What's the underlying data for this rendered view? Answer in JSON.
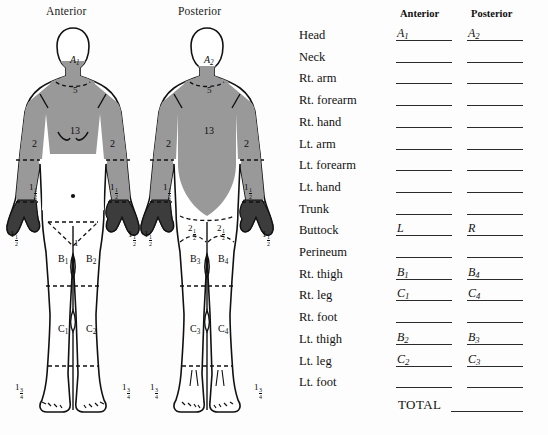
{
  "figures": {
    "anterior_title": "Anterior",
    "posterior_title": "Posterior",
    "shade_color": "#999999",
    "outline_color": "#111111",
    "anterior_annotations": [
      {
        "id": "head",
        "text": "A",
        "sub": "1",
        "size": "lg",
        "italic": true,
        "x": 70,
        "y": 41
      },
      {
        "id": "neck",
        "text": "5",
        "size": "md",
        "italic": false,
        "x": 73,
        "y": 72
      },
      {
        "id": "trunk",
        "text": "13",
        "size": "lg",
        "italic": false,
        "x": 70,
        "y": 112
      },
      {
        "id": "rt-arm",
        "text": "2",
        "size": "lg",
        "italic": false,
        "x": 32,
        "y": 125
      },
      {
        "id": "lt-arm",
        "text": "2",
        "size": "lg",
        "italic": false,
        "x": 110,
        "y": 125
      },
      {
        "id": "rt-forearm",
        "text": "1",
        "frac": "1/2",
        "size": "md",
        "italic": false,
        "x": 29,
        "y": 169
      },
      {
        "id": "lt-forearm",
        "text": "1",
        "frac": "1/2",
        "size": "md",
        "italic": false,
        "x": 110,
        "y": 169
      },
      {
        "id": "rt-hand",
        "text": "1",
        "frac": "1/2",
        "size": "md",
        "italic": false,
        "x": 10,
        "y": 216
      },
      {
        "id": "lt-hand",
        "text": "1",
        "frac": "1/2",
        "size": "md",
        "italic": false,
        "x": 128,
        "y": 216
      },
      {
        "id": "perineum",
        "text": "1",
        "size": "md",
        "italic": false,
        "x": 74,
        "y": 225
      },
      {
        "id": "rt-thigh",
        "text": "B",
        "sub": "1",
        "size": "lg",
        "italic": false,
        "x": 58,
        "y": 240
      },
      {
        "id": "lt-thigh",
        "text": "B",
        "sub": "2",
        "size": "lg",
        "italic": false,
        "x": 86,
        "y": 240
      },
      {
        "id": "rt-leg",
        "text": "C",
        "sub": "1",
        "size": "lg",
        "italic": false,
        "x": 58,
        "y": 310
      },
      {
        "id": "lt-leg",
        "text": "C",
        "sub": "2",
        "size": "lg",
        "italic": false,
        "x": 86,
        "y": 310
      },
      {
        "id": "rt-foot",
        "text": "1",
        "frac": "3/4",
        "size": "md",
        "italic": false,
        "x": 15,
        "y": 369
      },
      {
        "id": "lt-foot",
        "text": "1",
        "frac": "3/4",
        "size": "md",
        "italic": false,
        "x": 122,
        "y": 369
      }
    ],
    "posterior_annotations": [
      {
        "id": "head",
        "text": "A",
        "sub": "2",
        "size": "lg",
        "italic": true,
        "x": 204,
        "y": 41
      },
      {
        "id": "neck",
        "text": "5",
        "size": "md",
        "italic": false,
        "x": 207,
        "y": 72
      },
      {
        "id": "trunk",
        "text": "13",
        "size": "lg",
        "italic": false,
        "x": 204,
        "y": 112
      },
      {
        "id": "rt-arm",
        "text": "2",
        "size": "lg",
        "italic": false,
        "x": 166,
        "y": 125
      },
      {
        "id": "lt-arm",
        "text": "2",
        "size": "lg",
        "italic": false,
        "x": 244,
        "y": 125
      },
      {
        "id": "rt-forearm",
        "text": "1",
        "frac": "1/2",
        "size": "md",
        "italic": false,
        "x": 163,
        "y": 169
      },
      {
        "id": "lt-forearm",
        "text": "1",
        "frac": "1/2",
        "size": "md",
        "italic": false,
        "x": 244,
        "y": 169
      },
      {
        "id": "rt-hand",
        "text": "1",
        "frac": "1/2",
        "size": "md",
        "italic": false,
        "x": 144,
        "y": 216
      },
      {
        "id": "lt-hand",
        "text": "1",
        "frac": "1/2",
        "size": "md",
        "italic": false,
        "x": 262,
        "y": 216
      },
      {
        "id": "rt-buttock",
        "text": "2",
        "frac": "1/2",
        "size": "md",
        "italic": false,
        "x": 188,
        "y": 210
      },
      {
        "id": "lt-buttock",
        "text": "2",
        "frac": "1/2",
        "size": "md",
        "italic": false,
        "x": 217,
        "y": 210
      },
      {
        "id": "rt-thigh",
        "text": "B",
        "sub": "3",
        "size": "lg",
        "italic": false,
        "x": 190,
        "y": 240
      },
      {
        "id": "lt-thigh",
        "text": "B",
        "sub": "4",
        "size": "lg",
        "italic": false,
        "x": 218,
        "y": 240
      },
      {
        "id": "rt-leg",
        "text": "C",
        "sub": "3",
        "size": "lg",
        "italic": false,
        "x": 190,
        "y": 310
      },
      {
        "id": "lt-leg",
        "text": "C",
        "sub": "4",
        "size": "lg",
        "italic": false,
        "x": 218,
        "y": 310
      },
      {
        "id": "rt-foot",
        "text": "1",
        "frac": "3/4",
        "size": "md",
        "italic": false,
        "x": 150,
        "y": 369
      },
      {
        "id": "lt-foot",
        "text": "1",
        "frac": "3/4",
        "size": "md",
        "italic": false,
        "x": 254,
        "y": 369
      }
    ]
  },
  "table": {
    "column_headers": {
      "anterior": "Anterior",
      "posterior": "Posterior"
    },
    "total_label": "TOTAL",
    "rows": [
      {
        "label": "Head",
        "anterior": "A",
        "anterior_sub": "1",
        "posterior": "A",
        "posterior_sub": "2"
      },
      {
        "label": "Neck",
        "anterior": "",
        "posterior": ""
      },
      {
        "label": "Rt. arm",
        "anterior": "",
        "posterior": ""
      },
      {
        "label": "Rt. forearm",
        "anterior": "",
        "posterior": ""
      },
      {
        "label": "Rt. hand",
        "anterior": "",
        "posterior": ""
      },
      {
        "label": "Lt. arm",
        "anterior": "",
        "posterior": ""
      },
      {
        "label": "Lt. forearm",
        "anterior": "",
        "posterior": ""
      },
      {
        "label": "Lt. hand",
        "anterior": "",
        "posterior": ""
      },
      {
        "label": "Trunk",
        "anterior": "",
        "posterior": ""
      },
      {
        "label": "Buttock",
        "anterior": "L",
        "posterior": "R"
      },
      {
        "label": "Perineum",
        "anterior": "",
        "posterior": ""
      },
      {
        "label": "Rt. thigh",
        "anterior": "B",
        "anterior_sub": "1",
        "posterior": "B",
        "posterior_sub": "4"
      },
      {
        "label": "Rt. leg",
        "anterior": "C",
        "anterior_sub": "1",
        "posterior": "C",
        "posterior_sub": "4"
      },
      {
        "label": "Rt. foot",
        "anterior": "",
        "posterior": ""
      },
      {
        "label": "Lt. thigh",
        "anterior": "B",
        "anterior_sub": "2",
        "posterior": "B",
        "posterior_sub": "3"
      },
      {
        "label": "Lt. leg",
        "anterior": "C",
        "anterior_sub": "2",
        "posterior": "C",
        "posterior_sub": "3"
      },
      {
        "label": "Lt. foot",
        "anterior": "",
        "posterior": ""
      }
    ]
  }
}
